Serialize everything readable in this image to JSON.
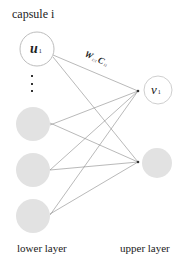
{
  "title": "capsule i",
  "nodes": {
    "lower": [
      {
        "label": "u",
        "sub": "1",
        "style": "outline"
      },
      {
        "label": "",
        "style": "filled"
      },
      {
        "label": "",
        "style": "filled"
      },
      {
        "label": "",
        "style": "filled"
      }
    ],
    "upper": [
      {
        "label": "v",
        "sub": "1",
        "style": "outline"
      },
      {
        "label": "",
        "style": "filled"
      }
    ]
  },
  "edge_label": {
    "w": "W",
    "w_sub": "1|1",
    "c": "C",
    "c_sub": "11"
  },
  "ellipsis": "⋮",
  "labels": {
    "lower_layer": "lower layer",
    "upper_layer": "upper layer"
  },
  "colors": {
    "line": "#8a8a8a",
    "filled_node": "#e2e2e2",
    "outline": "#bdbdbd"
  }
}
